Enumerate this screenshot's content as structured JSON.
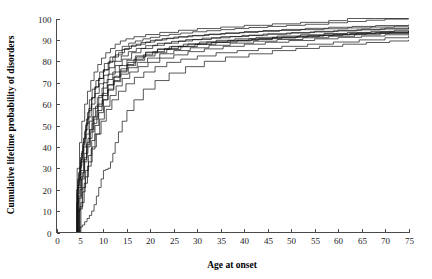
{
  "chart_data": {
    "type": "line",
    "title": "",
    "xlabel": "Age at onset",
    "ylabel": "Cumulative lifetime probability of disorders",
    "xlim": [
      0,
      75
    ],
    "ylim": [
      0,
      100
    ],
    "xticks": [
      0,
      5,
      10,
      15,
      20,
      25,
      30,
      35,
      40,
      45,
      50,
      55,
      60,
      65,
      70,
      75
    ],
    "yticks": [
      0,
      10,
      20,
      30,
      40,
      50,
      60,
      70,
      80,
      90,
      100
    ],
    "grid": false,
    "legend": "none",
    "step_style": "post",
    "series": [
      {
        "name": "curve-1",
        "x": [
          0,
          4.0,
          4.3,
          4.6,
          5.0,
          5.4,
          5.8,
          6.2,
          6.6,
          7.0,
          7.6,
          8.4,
          9.2,
          10.2,
          11.4,
          12.6,
          14.0,
          15.4,
          16.8,
          18.4,
          20.0,
          22.0,
          24.0,
          26.5,
          29.0,
          32.0,
          35.0,
          38.0,
          41.0,
          45.0,
          49.0,
          53.0,
          58.0,
          62.0,
          66.0,
          70.0,
          75.0
        ],
        "y": [
          0,
          0,
          14,
          24,
          31,
          38,
          44,
          50,
          56,
          62,
          67,
          71,
          75,
          79,
          82,
          85,
          87,
          88.5,
          89.5,
          90.5,
          91.2,
          92,
          92.6,
          93.2,
          93.8,
          94.3,
          94.8,
          95.3,
          95.8,
          96.3,
          96.8,
          97.3,
          98.0,
          98.6,
          99.2,
          99.7,
          100
        ]
      },
      {
        "name": "curve-2",
        "x": [
          0,
          4.2,
          4.6,
          5.0,
          5.5,
          6.0,
          6.5,
          7.0,
          7.6,
          8.3,
          9.0,
          10.0,
          11.0,
          12.5,
          14.0,
          16.0,
          18.0,
          20.5,
          23.0,
          26.0,
          29.0,
          33.0,
          37.0,
          41.0,
          45.0,
          50.0,
          55.0,
          60.0,
          65.0,
          70.0,
          75.0
        ],
        "y": [
          0,
          0,
          10,
          20,
          28,
          35,
          42,
          48,
          54,
          59,
          64,
          70,
          74,
          78,
          81,
          84,
          86,
          87.5,
          88.5,
          89.5,
          90.2,
          91,
          91.6,
          92.2,
          92.8,
          93.4,
          94.0,
          94.5,
          95.0,
          95.5,
          96.0
        ]
      },
      {
        "name": "curve-3",
        "x": [
          0,
          4.0,
          4.4,
          4.8,
          5.2,
          5.6,
          6.0,
          6.4,
          6.9,
          7.5,
          8.2,
          9.0,
          10.0,
          11.2,
          12.5,
          14.0,
          15.5,
          17.0,
          19.0,
          21.0,
          23.5,
          26.0,
          29.0,
          32.5,
          36.0,
          40.0,
          44.0,
          48.0,
          53.0,
          58.0,
          63.0,
          68.0,
          75.0
        ],
        "y": [
          0,
          0,
          18,
          27,
          34,
          41,
          47,
          53,
          58,
          63,
          68,
          72,
          76,
          80,
          83,
          85.5,
          87,
          88,
          89,
          90,
          90.8,
          91.5,
          92.1,
          92.7,
          93.3,
          93.9,
          94.4,
          94.9,
          95.4,
          95.9,
          96.3,
          96.7,
          97.1
        ]
      },
      {
        "name": "curve-4",
        "x": [
          0,
          4.5,
          5.0,
          5.6,
          6.2,
          6.8,
          7.5,
          8.2,
          9.0,
          10.0,
          11.0,
          12.2,
          13.5,
          15.0,
          16.5,
          18.5,
          20.5,
          23.0,
          26.0,
          29.5,
          33.0,
          37.0,
          41.5,
          46.0,
          51.0,
          56.0,
          61.0,
          66.0,
          71.0,
          75.0
        ],
        "y": [
          0,
          0,
          12,
          21,
          29,
          36,
          43,
          50,
          56,
          62,
          67,
          71,
          75,
          78.5,
          81,
          83,
          84.5,
          86,
          87,
          88,
          88.8,
          89.5,
          90.2,
          90.9,
          91.5,
          92.1,
          92.6,
          93.1,
          93.6,
          94.0
        ]
      },
      {
        "name": "curve-5",
        "x": [
          0,
          4.1,
          4.5,
          4.9,
          5.3,
          5.8,
          6.3,
          6.9,
          7.5,
          8.2,
          9.0,
          10.0,
          11.0,
          12.0,
          13.2,
          14.5,
          16.0,
          18.0,
          20.0,
          22.5,
          25.0,
          28.0,
          31.5,
          35.0,
          39.0,
          43.0,
          47.5,
          52.0,
          57.0,
          62.0,
          67.0,
          72.0,
          75.0
        ],
        "y": [
          0,
          0,
          22,
          30,
          37,
          44,
          51,
          57,
          63,
          68,
          72,
          76,
          79.5,
          82,
          84,
          86,
          87.5,
          88.8,
          89.8,
          90.6,
          91.3,
          91.9,
          92.5,
          93.0,
          93.5,
          94.0,
          94.4,
          94.8,
          95.2,
          95.6,
          96.0,
          96.4,
          96.6
        ]
      },
      {
        "name": "curve-6-fast",
        "x": [
          0,
          4.0,
          4.4,
          4.9,
          5.4,
          6.0,
          6.6,
          7.3,
          8.0,
          8.8,
          9.6,
          10.5,
          11.5,
          12.5,
          13.6,
          14.8,
          16.5,
          19.0,
          22.0,
          26.0,
          30.0,
          35.0,
          40.0,
          46.0,
          52.0,
          58.0,
          62.0,
          68.0,
          75.0
        ],
        "y": [
          0,
          0,
          30,
          42,
          52,
          60,
          66,
          71,
          75,
          78.5,
          81.5,
          84,
          86,
          88,
          89.5,
          90.5,
          91.5,
          92.5,
          93.5,
          94.5,
          95.3,
          96.0,
          96.8,
          97.5,
          98.2,
          99.0,
          100,
          100,
          100
        ]
      },
      {
        "name": "curve-7",
        "x": [
          0,
          4.3,
          4.8,
          5.3,
          5.9,
          6.5,
          7.2,
          8.0,
          8.9,
          9.9,
          11.0,
          12.3,
          13.7,
          15.2,
          17.0,
          19.0,
          21.5,
          24.0,
          27.0,
          30.5,
          34.0,
          38.0,
          42.5,
          47.0,
          52.0,
          57.0,
          62.0,
          67.0,
          72.0,
          75.0
        ],
        "y": [
          0,
          0,
          16,
          25,
          33,
          40,
          47,
          53,
          59,
          64,
          69,
          73,
          76.5,
          79.5,
          82,
          84,
          85.5,
          86.8,
          88,
          89,
          89.8,
          90.5,
          91.2,
          91.8,
          92.4,
          93.0,
          93.5,
          94.0,
          94.5,
          94.8
        ]
      },
      {
        "name": "curve-8",
        "x": [
          0,
          4.6,
          5.2,
          5.9,
          6.6,
          7.4,
          8.2,
          9.2,
          10.2,
          11.4,
          12.7,
          14.0,
          15.6,
          17.4,
          19.5,
          22.0,
          25.0,
          28.0,
          31.5,
          35.5,
          40.0,
          44.5,
          49.5,
          55.0,
          60.0,
          65.0,
          70.0,
          75.0
        ],
        "y": [
          0,
          0,
          14,
          23,
          31,
          39,
          46,
          53,
          59,
          64,
          68.5,
          72,
          75,
          77.5,
          79.5,
          81.5,
          83,
          84.5,
          85.8,
          87,
          88,
          88.9,
          89.7,
          90.5,
          91.2,
          91.8,
          92.4,
          93.0
        ]
      },
      {
        "name": "curve-9",
        "x": [
          0,
          4.0,
          4.3,
          4.7,
          5.1,
          5.6,
          6.1,
          6.7,
          7.4,
          8.2,
          9.1,
          10.1,
          11.2,
          12.4,
          13.8,
          15.3,
          17.0,
          19.0,
          21.5,
          24.5,
          27.5,
          31.0,
          35.0,
          39.5,
          44.0,
          49.0,
          54.0,
          59.0,
          64.0,
          69.0,
          75.0
        ],
        "y": [
          0,
          0,
          20,
          28,
          35,
          42,
          48,
          54,
          60,
          65,
          69.5,
          73.5,
          77,
          80,
          82.5,
          84.5,
          86,
          87.3,
          88.4,
          89.3,
          90.1,
          90.8,
          91.5,
          92.1,
          92.7,
          93.2,
          93.7,
          94.2,
          94.7,
          95.1,
          95.5
        ]
      },
      {
        "name": "curve-10",
        "x": [
          0,
          4.2,
          4.7,
          5.2,
          5.8,
          6.4,
          7.1,
          7.9,
          8.8,
          9.8,
          10.9,
          12.1,
          13.5,
          15.0,
          16.8,
          18.8,
          21.0,
          23.5,
          26.5,
          30.0,
          34.0,
          38.5,
          43.0,
          48.0,
          53.5,
          59.0,
          64.0,
          69.0,
          75.0
        ],
        "y": [
          0,
          0,
          17,
          26,
          34,
          41,
          48,
          54,
          60,
          65,
          69,
          72.5,
          75.5,
          78,
          80.5,
          82.5,
          84,
          85.5,
          86.8,
          88,
          89,
          89.8,
          90.6,
          91.3,
          92.0,
          92.6,
          93.2,
          93.7,
          94.2
        ]
      },
      {
        "name": "curve-11",
        "x": [
          0,
          4.0,
          4.5,
          5.1,
          5.7,
          6.3,
          7.0,
          7.8,
          8.7,
          9.7,
          10.8,
          12.0,
          13.4,
          15.0,
          16.8,
          19.0,
          21.5,
          24.5,
          28.0,
          32.0,
          36.5,
          41.0,
          46.0,
          51.5,
          57.0,
          62.5,
          68.0,
          75.0
        ],
        "y": [
          0,
          0,
          25,
          33,
          40,
          46,
          52,
          58,
          63,
          67.5,
          71.5,
          75,
          78,
          80.5,
          82.5,
          84.3,
          85.8,
          87,
          88.1,
          89,
          89.8,
          90.5,
          91.2,
          91.8,
          92.4,
          93.0,
          93.5,
          94.0
        ]
      },
      {
        "name": "curve-12-low",
        "x": [
          0,
          4.4,
          4.9,
          5.5,
          6.1,
          6.8,
          7.6,
          8.5,
          9.5,
          10.6,
          11.8,
          13.2,
          14.8,
          16.6,
          18.6,
          21.0,
          23.5,
          26.5,
          30.0,
          34.0,
          38.5,
          43.0,
          48.0,
          53.5,
          59.0,
          64.5,
          70.0,
          75.0
        ],
        "y": [
          0,
          0,
          11,
          19,
          26,
          33,
          40,
          46,
          52,
          57.5,
          62,
          66,
          69.5,
          72.5,
          75,
          77.5,
          79.5,
          81,
          82.5,
          84,
          85,
          86,
          87,
          88,
          89,
          90,
          91,
          92
        ]
      },
      {
        "name": "curve-13-outlier",
        "x": [
          0,
          4.5,
          5.0,
          5.5,
          6.0,
          6.5,
          7.0,
          7.5,
          8.0,
          8.5,
          9.0,
          9.5,
          10.0,
          10.5,
          11.0,
          11.5,
          12.0,
          12.5,
          13.2,
          14.0,
          15.0,
          16.5,
          18.5,
          21.0,
          24.0,
          27.5,
          31.5,
          36.0,
          41.0,
          46.0,
          51.0,
          56.0,
          61.0,
          66.0,
          71.0,
          75.0
        ],
        "y": [
          0,
          0,
          2.5,
          3.5,
          5,
          6.5,
          8,
          10,
          13,
          17,
          21,
          25,
          29,
          29.5,
          30,
          33,
          37,
          42,
          47,
          52,
          57,
          62,
          67,
          71,
          74.5,
          77.5,
          80,
          82,
          83.5,
          85,
          86,
          87,
          88,
          88.8,
          89.5,
          90
        ]
      },
      {
        "name": "curve-14",
        "x": [
          0,
          4.1,
          4.6,
          5.2,
          5.9,
          6.7,
          7.6,
          8.6,
          9.7,
          10.9,
          12.2,
          13.7,
          15.3,
          17.2,
          19.4,
          22.0,
          25.0,
          28.5,
          32.5,
          37.0,
          42.0,
          47.0,
          52.5,
          58.0,
          63.5,
          69.0,
          75.0
        ],
        "y": [
          0,
          0,
          21,
          29,
          37,
          44,
          51,
          57,
          62,
          66.5,
          70.5,
          74,
          77,
          79.5,
          81.5,
          83.5,
          85,
          86.3,
          87.5,
          88.5,
          89.4,
          90.2,
          91.0,
          91.7,
          92.4,
          93.0,
          93.6
        ]
      }
    ]
  },
  "axes": {
    "x_title": "Age at onset",
    "y_title": "Cumulative lifetime probability of disorders",
    "x_tick_labels": [
      "0",
      "5",
      "10",
      "15",
      "20",
      "25",
      "30",
      "35",
      "40",
      "45",
      "50",
      "55",
      "60",
      "65",
      "70",
      "75"
    ],
    "y_tick_labels": [
      "0",
      "10",
      "20",
      "30",
      "40",
      "50",
      "60",
      "70",
      "80",
      "90",
      "100"
    ]
  },
  "style": {
    "line_color": "#111111",
    "axis_color": "#4a4a4a",
    "text_color": "#1a1a1a",
    "background": "#ffffff"
  }
}
